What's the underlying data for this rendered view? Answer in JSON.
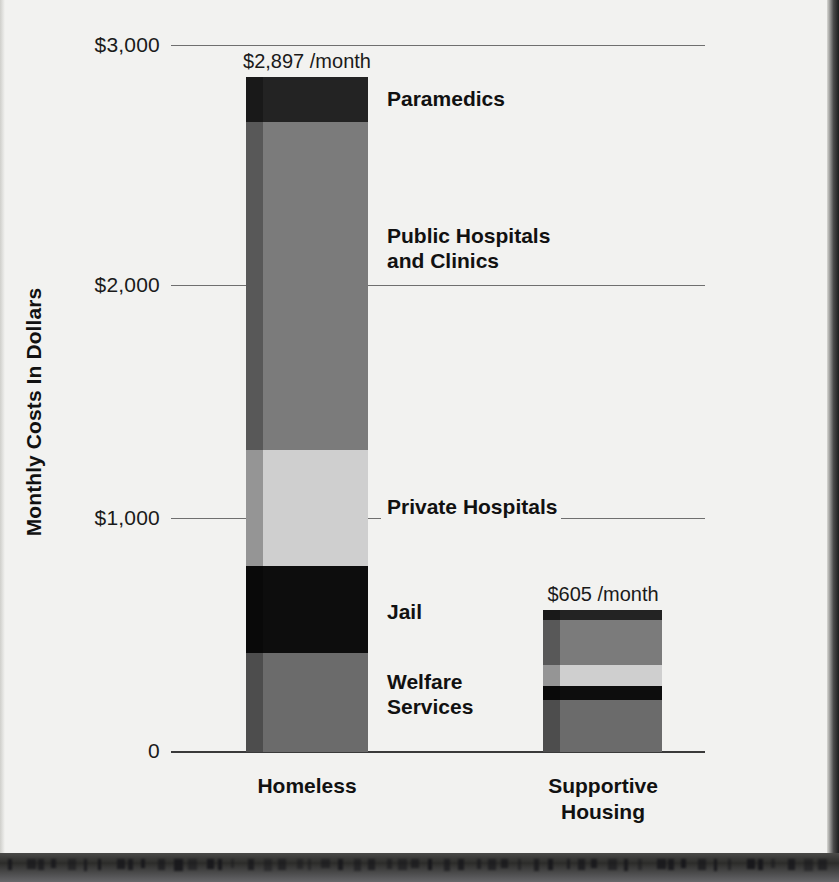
{
  "chart_data": {
    "type": "bar",
    "subtype": "stacked-vertical",
    "title": "",
    "xlabel": "",
    "ylabel": "Monthly Costs In Dollars",
    "ylim": [
      0,
      3000
    ],
    "yticks": [
      0,
      1000,
      2000,
      3000
    ],
    "ytick_labels": [
      "0",
      "$1,000",
      "$2,000",
      "$3,000"
    ],
    "grid": true,
    "legend_position": "inline-callout-right",
    "categories": [
      "Homeless",
      "Supportive Housing"
    ],
    "category_display": [
      "Homeless",
      "Supportive\nHousing"
    ],
    "series": [
      {
        "name": "Paramedics",
        "values": [
          191,
          42
        ]
      },
      {
        "name": "Public Hospitals and Clinics",
        "values": [
          1392,
          191
        ]
      },
      {
        "name": "Private Hospitals",
        "values": [
          492,
          89
        ]
      },
      {
        "name": "Jail",
        "values": [
          369,
          59
        ]
      },
      {
        "name": "Welfare Services",
        "values": [
          421,
          224
        ]
      }
    ],
    "totals": [
      2897,
      605
    ],
    "total_labels": [
      "$2,897 /month",
      "$605 /month"
    ],
    "series_display_labels": [
      "Paramedics",
      "Public Hospitals\nand Clinics",
      "Private Hospitals",
      "Jail",
      "Welfare\nServices"
    ],
    "colors": {
      "paramedics": "#232323",
      "public_hospitals": "#7b7b7b",
      "private_hospitals": "#cfcfcf",
      "jail": "#0d0d0d",
      "welfare_services": "#6b6b6b",
      "background": "#f2f2f0",
      "gridline": "#6f6f6f",
      "text": "#111111"
    }
  }
}
